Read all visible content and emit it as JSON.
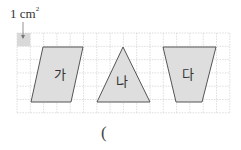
{
  "unit": {
    "text": "1 cm",
    "exponent": "2"
  },
  "grid": {
    "left": 17,
    "top": 33,
    "cols": 16,
    "rows": 6,
    "cell": 13.3,
    "line_color": "#c8c8c8",
    "unit_cell_color": "#d9d9d9"
  },
  "shapes": [
    {
      "name": "parallelogram",
      "label": "가",
      "points": "43,47 83,47 71,102 31,102",
      "label_x": 54,
      "label_y": 79
    },
    {
      "name": "triangle",
      "label": "나",
      "points": "123,47 150,102 97,102",
      "label_x": 116,
      "label_y": 86
    },
    {
      "name": "trapezoid",
      "label": "다",
      "points": "163,47 216,47 202,102 176,102",
      "label_x": 182,
      "label_y": 79
    }
  ],
  "shape_fill": "#dedede",
  "shape_stroke": "#555555",
  "answer": {
    "open_paren": "("
  }
}
